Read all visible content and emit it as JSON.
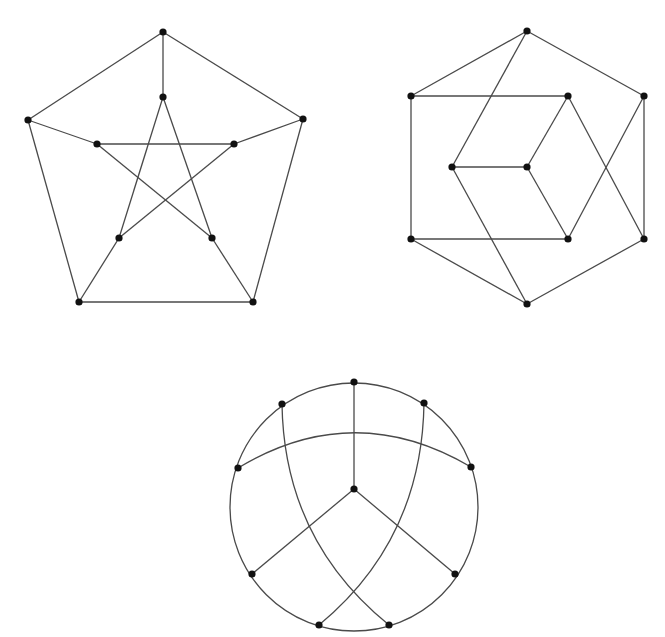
{
  "figure": {
    "colors": {
      "background": "#ffffff",
      "edge": "#4a4a4a",
      "vertex": "#111111"
    },
    "vertex_radius": 3.6
  },
  "graphs": [
    {
      "id": "pentagram-drawing",
      "vertices": {
        "outer_top": [
          163,
          32
        ],
        "outer_right": [
          303,
          119
        ],
        "outer_bottom_right": [
          253,
          302
        ],
        "outer_bottom_left": [
          79,
          302
        ],
        "outer_left": [
          28,
          120
        ],
        "inner_top": [
          163,
          97
        ],
        "inner_right": [
          234,
          144
        ],
        "inner_lower_right": [
          212,
          238
        ],
        "inner_lower_left": [
          119,
          238
        ],
        "inner_left": [
          97,
          144
        ]
      },
      "edges": [
        [
          "outer_top",
          "outer_right"
        ],
        [
          "outer_right",
          "outer_bottom_right"
        ],
        [
          "outer_bottom_right",
          "outer_bottom_left"
        ],
        [
          "outer_bottom_left",
          "outer_left"
        ],
        [
          "outer_left",
          "outer_top"
        ],
        [
          "outer_top",
          "inner_top"
        ],
        [
          "outer_right",
          "inner_right"
        ],
        [
          "outer_bottom_right",
          "inner_lower_right"
        ],
        [
          "outer_bottom_left",
          "inner_lower_left"
        ],
        [
          "outer_left",
          "inner_left"
        ],
        [
          "inner_top",
          "inner_lower_left"
        ],
        [
          "inner_top",
          "inner_lower_right"
        ],
        [
          "inner_left",
          "inner_right"
        ],
        [
          "inner_left",
          "inner_lower_right"
        ],
        [
          "inner_right",
          "inner_lower_left"
        ]
      ]
    },
    {
      "id": "hexagon-cube-drawing",
      "vertices": {
        "top": [
          527,
          31
        ],
        "left_upper": [
          411,
          96
        ],
        "inner_upper_right": [
          568,
          96
        ],
        "right_upper": [
          644,
          96
        ],
        "inner_left": [
          452,
          167
        ],
        "inner_center": [
          527,
          167
        ],
        "left_lower": [
          411,
          239
        ],
        "inner_lower": [
          568,
          239
        ],
        "right_lower": [
          644,
          239
        ],
        "bottom": [
          527,
          304
        ]
      },
      "edges": [
        [
          "top",
          "left_upper"
        ],
        [
          "top",
          "right_upper"
        ],
        [
          "top",
          "inner_left"
        ],
        [
          "left_upper",
          "inner_upper_right"
        ],
        [
          "left_upper",
          "left_lower"
        ],
        [
          "right_upper",
          "right_lower"
        ],
        [
          "right_upper",
          "inner_lower"
        ],
        [
          "inner_upper_right",
          "inner_center"
        ],
        [
          "inner_upper_right",
          "right_lower"
        ],
        [
          "inner_left",
          "inner_center"
        ],
        [
          "inner_left",
          "bottom"
        ],
        [
          "inner_center",
          "inner_lower"
        ],
        [
          "left_lower",
          "inner_lower"
        ],
        [
          "left_lower",
          "bottom"
        ],
        [
          "right_lower",
          "bottom"
        ]
      ]
    },
    {
      "id": "circle-drawing",
      "circle": {
        "cx": 354,
        "cy": 507,
        "r": 124
      },
      "vertices": {
        "top": [
          354,
          382
        ],
        "upper_right": [
          424,
          403
        ],
        "right": [
          471,
          467
        ],
        "lower_right": [
          455,
          574
        ],
        "bottom_right": [
          389,
          625
        ],
        "bottom_left": [
          319,
          625
        ],
        "lower_left": [
          252,
          574
        ],
        "left": [
          238,
          468
        ],
        "upper_left": [
          282,
          404
        ],
        "center": [
          354,
          489
        ]
      },
      "edges": [
        [
          "top",
          "center"
        ],
        [
          "center",
          "lower_left"
        ],
        [
          "center",
          "lower_right"
        ]
      ],
      "arcs": [
        {
          "from": "left",
          "to": "right",
          "path": "M238,468 Q354,398 471,467"
        },
        {
          "from": "upper_left",
          "to": "bottom_right",
          "path": "M282,404 Q284,540 389,625"
        },
        {
          "from": "upper_right",
          "to": "bottom_left",
          "path": "M424,403 Q422,540 319,625"
        }
      ]
    }
  ]
}
